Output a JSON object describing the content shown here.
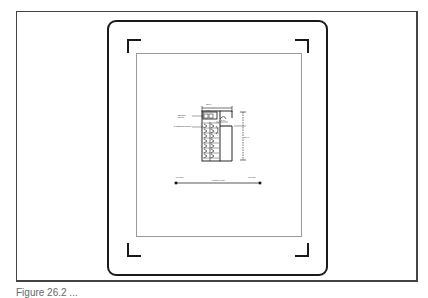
{
  "figure": {
    "caption": "Figure 26.2 ..."
  },
  "diagram": {
    "labels": {
      "top_dim": "12'-0\"",
      "sub_dim": "8'-0\"",
      "mid_dim": "5'-0\"",
      "right_dim": "24'-0\"",
      "left_top_label": "Storage Room",
      "left_mid_label": "2' Stalls Required",
      "bottom_left": "Lot Line",
      "bottom_right": "Lot Line",
      "bottom_center": "Property Line"
    }
  }
}
